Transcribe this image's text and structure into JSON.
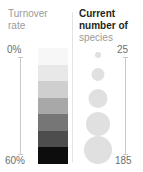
{
  "chart_data": {
    "type": "table",
    "panels": [
      {
        "name": "turnover-rate",
        "title_lines": [
          "Turnover",
          "rate"
        ],
        "title_style": "light",
        "encoding": "color-gradient-bar",
        "unit": "%",
        "axis_min_label": "0%",
        "axis_max_label": "60%",
        "axis_range": [
          0,
          60
        ],
        "bands": [
          {
            "index": 0,
            "value_range": [
              0,
              8.6
            ],
            "color": "#f7f7f7"
          },
          {
            "index": 1,
            "value_range": [
              8.6,
              17.1
            ],
            "color": "#e8e8e8"
          },
          {
            "index": 2,
            "value_range": [
              17.1,
              25.7
            ],
            "color": "#cfcfcf"
          },
          {
            "index": 3,
            "value_range": [
              25.7,
              34.3
            ],
            "color": "#a8a8a8"
          },
          {
            "index": 4,
            "value_range": [
              34.3,
              42.9
            ],
            "color": "#767676"
          },
          {
            "index": 5,
            "value_range": [
              42.9,
              51.4
            ],
            "color": "#4d4d4d"
          },
          {
            "index": 6,
            "value_range": [
              51.4,
              60
            ],
            "color": "#0d0d0d"
          }
        ]
      },
      {
        "name": "current-number-of-species",
        "title_lines": [
          "Current",
          "number of",
          "species"
        ],
        "title_bold_lines": [
          "Current",
          "number of"
        ],
        "title_light_lines": [
          "species"
        ],
        "encoding": "proportional-circle-area",
        "unit": "species",
        "axis_min_label": "25",
        "axis_max_label": "185",
        "axis_range": [
          25,
          185
        ],
        "circles": [
          {
            "index": 0,
            "value": 25,
            "diameter_px": 6,
            "color": "#e0e0e0"
          },
          {
            "index": 1,
            "value": 65,
            "diameter_px": 13,
            "color": "#e0e0e0"
          },
          {
            "index": 2,
            "value": 105,
            "diameter_px": 19,
            "color": "#e0e0e0"
          },
          {
            "index": 3,
            "value": 145,
            "diameter_px": 24,
            "color": "#e0e0e0"
          },
          {
            "index": 4,
            "value": 185,
            "diameter_px": 28,
            "color": "#e0e0e0"
          }
        ]
      }
    ],
    "colors": {
      "text_dark": "#231f20",
      "text_light": "#9a9a9a",
      "axis_label": "#6d6d6d",
      "axis_line": "#c9c9c9",
      "divider": "#e3e3e3",
      "bubble": "#e0e0e0",
      "background": "#ffffff"
    }
  }
}
